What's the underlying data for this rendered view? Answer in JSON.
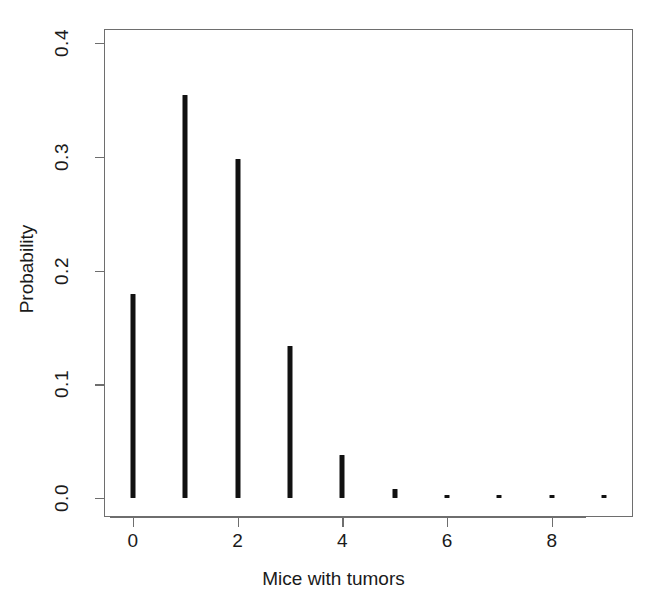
{
  "chart_data": {
    "type": "bar",
    "title": "",
    "subtitle": "",
    "xlabel": "Mice with tumors",
    "ylabel": "Probability",
    "categories": [
      0,
      1,
      2,
      3,
      4,
      5,
      6,
      7,
      8,
      9
    ],
    "values": [
      0.1797,
      0.3545,
      0.298,
      0.1333,
      0.0376,
      0.008,
      0.0018,
      0.0012,
      0.0012,
      0.0012
    ],
    "series": [
      {
        "name": "Probability",
        "values": [
          0.1797,
          0.3545,
          0.298,
          0.1333,
          0.0376,
          0.008,
          0.0018,
          0.0012,
          0.0012,
          0.0012
        ]
      }
    ],
    "xlim": [
      -0.55,
      9.55
    ],
    "ylim": [
      0.0,
      0.4
    ],
    "xticks": [
      0,
      2,
      4,
      6,
      8
    ],
    "xtick_labels": [
      "0",
      "2",
      "4",
      "6",
      "8"
    ],
    "yticks": [
      0.0,
      0.1,
      0.2,
      0.3,
      0.4
    ],
    "ytick_labels": [
      "0.0",
      "0.1",
      "0.2",
      "0.3",
      "0.4"
    ],
    "grid": false,
    "legend": false,
    "legend_position": "none",
    "bar_color": "#111111",
    "axis_color": "#6e6e6e",
    "background_color": "#ffffff",
    "style": "stem-plot (R type='h')"
  }
}
